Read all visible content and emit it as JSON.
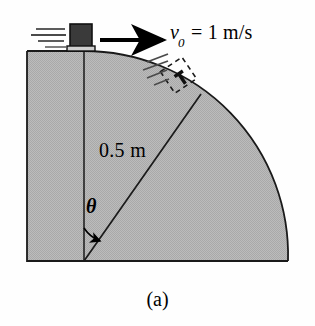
{
  "figure": {
    "caption": "(a)",
    "background_color": "#fefefe",
    "surface_fill_color": "#b6b6b6",
    "outline_color": "#1a1a1a",
    "block_color": "#3a3a3a"
  },
  "labels": {
    "velocity_symbol": "v",
    "velocity_subscript": "0",
    "velocity_equation": "= 1 m/s",
    "velocity_full": "v0 = 1 m/s",
    "radius": "0.5 m",
    "angle": "θ"
  },
  "geometry": {
    "baseline_y": 261,
    "left_edge_x": 27,
    "right_edge_x": 288,
    "top_edge_y": 51,
    "center_x": 84,
    "center_y": 261,
    "radius_px": 204,
    "radius_value_m": 0.5,
    "radius_line_angle_deg": 35,
    "initial_speed_value": 1,
    "initial_speed_units": "m/s"
  },
  "icons": {
    "velocity_arrow": "right-arrow-icon",
    "motion_lines": "speed-lines-icon",
    "ghost_block": "dashed-block-icon",
    "angle_arc": "angle-arc-arrow-icon",
    "sliding_block": "block-icon"
  }
}
